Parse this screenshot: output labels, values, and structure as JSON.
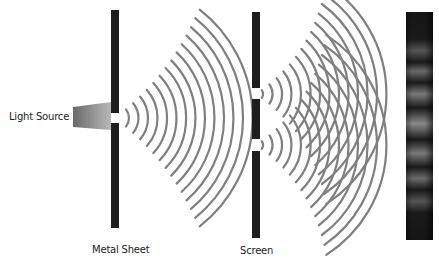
{
  "diagram": {
    "labels": {
      "light_source": "Light Source",
      "metal_sheet": "Metal Sheet",
      "screen": "Screen"
    },
    "colors": {
      "barrier": "#1e1e1e",
      "wave": "#7f7f7f",
      "detector_dark": "#151515",
      "detector_bright": "#8a8a8a",
      "source_light": "#a0a0a0",
      "source_dark": "#6a6a6a"
    },
    "elements": {
      "light_source": {
        "shape": "trapezoid",
        "x": 73,
        "y": 102,
        "width": 38,
        "height": 28
      },
      "metal_sheet": {
        "x": 111,
        "width": 8,
        "top": 10,
        "bottom": 228,
        "slit": {
          "y1": 113,
          "y2": 123
        }
      },
      "screen": {
        "x": 252,
        "width": 8,
        "top": 12,
        "bottom": 238,
        "slits": [
          {
            "y1": 88,
            "y2": 99
          },
          {
            "y1": 139,
            "y2": 151
          }
        ]
      },
      "detector": {
        "x": 406,
        "y": 12,
        "width": 27,
        "height": 228,
        "fringe_count": 8
      }
    },
    "waves": {
      "single_slit": {
        "center": [
          115,
          118
        ],
        "count": 14,
        "r_start": 14,
        "r_step": 9.5,
        "angle_start": 10,
        "angle_end": 48
      },
      "upper_slit": {
        "center": [
          256,
          94
        ],
        "count": 14,
        "r_start": 7,
        "r_step": 9.5
      },
      "lower_slit": {
        "center": [
          256,
          145
        ],
        "count": 14,
        "r_start": 7,
        "r_step": 9.5
      }
    }
  }
}
